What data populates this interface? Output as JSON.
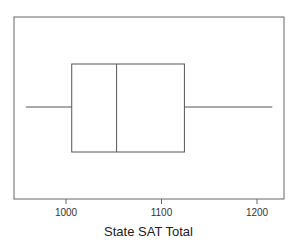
{
  "chart_data": {
    "type": "box",
    "title": "",
    "xlabel": "State SAT Total",
    "ylabel": "",
    "orientation": "horizontal",
    "xlim": [
      943,
      1228
    ],
    "xticks": [
      1000,
      1100,
      1200
    ],
    "xtick_labels": [
      "1000",
      "1100",
      "1200"
    ],
    "grid": false,
    "legend": null,
    "series": [
      {
        "name": "State SAT Total",
        "whisker_low": 958,
        "q1": 1006,
        "median": 1053,
        "q3": 1124,
        "whisker_high": 1216
      }
    ]
  },
  "style": {
    "line_color": "#555555",
    "frame_color": "#666666",
    "background": "#ffffff"
  }
}
